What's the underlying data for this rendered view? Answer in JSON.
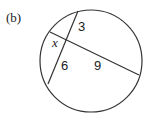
{
  "figure": {
    "part_label": "(b)",
    "segments": {
      "x": "x",
      "a": "3",
      "b": "6",
      "c": "9"
    },
    "stroke_color": "#333333"
  }
}
